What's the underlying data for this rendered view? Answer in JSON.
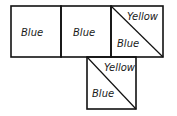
{
  "diagram": {
    "faces": [
      {
        "id": "face-1",
        "type": "single",
        "label": "Blue"
      },
      {
        "id": "face-2",
        "type": "single",
        "label": "Blue"
      },
      {
        "id": "face-3",
        "type": "split-diagonal",
        "upper_label": "Yellow",
        "lower_label": "Blue"
      },
      {
        "id": "face-4",
        "type": "split-diagonal",
        "upper_label": "Yellow",
        "lower_label": "Blue"
      }
    ]
  }
}
